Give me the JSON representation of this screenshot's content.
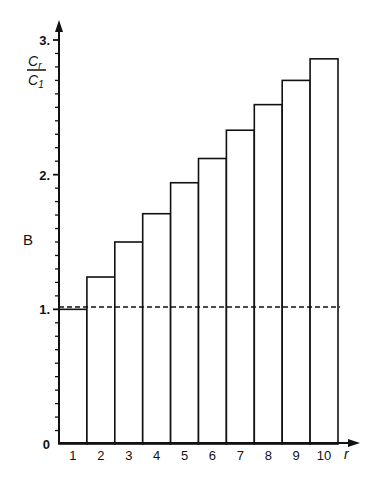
{
  "chart_data": {
    "type": "bar",
    "title": "",
    "xlabel": "r",
    "ylabel": "C_r / C_1",
    "side_label": "B",
    "categories": [
      "1",
      "2",
      "3",
      "4",
      "5",
      "6",
      "7",
      "8",
      "9",
      "10"
    ],
    "values": [
      1.0,
      1.24,
      1.5,
      1.71,
      1.94,
      2.12,
      2.33,
      2.52,
      2.7,
      2.86
    ],
    "y_ticks": [
      "0",
      "1.",
      "2.",
      "3."
    ],
    "y_tick_values": [
      0,
      1,
      2,
      3
    ],
    "ylim": [
      0,
      3
    ],
    "reference_line": {
      "y": 1.0,
      "style": "dashed"
    },
    "grid": false,
    "legend": null,
    "bar_style": {
      "fill": "#ffffff",
      "stroke": "#111111"
    }
  },
  "labels": {
    "ylabel_num": "C",
    "ylabel_num_sub": "r",
    "ylabel_den": "C",
    "ylabel_den_sub": "1",
    "side": "B",
    "x_axis": "r"
  }
}
